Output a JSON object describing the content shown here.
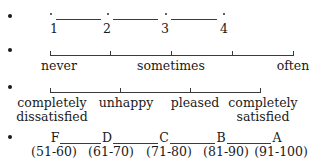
{
  "scales": [
    {
      "type": "numeric",
      "labels": [
        "1",
        "2",
        "3",
        "4"
      ]
    },
    {
      "type": "frequency",
      "labels": [
        "never",
        "sometimes",
        "often"
      ]
    },
    {
      "type": "satisfaction",
      "labels": [
        {
          "line1": "completely",
          "line2": "dissatisfied"
        },
        {
          "line1": "unhappy",
          "line2": ""
        },
        {
          "line1": "pleased",
          "line2": ""
        },
        {
          "line1": "completely",
          "line2": "satisfied"
        }
      ]
    },
    {
      "type": "grades",
      "grades": [
        {
          "letter": "F",
          "range": "(51-60)"
        },
        {
          "letter": "D",
          "range": "(61-70)"
        },
        {
          "letter": "C",
          "range": "(71-80)"
        },
        {
          "letter": "B",
          "range": "(81-90)"
        },
        {
          "letter": "A",
          "range": "(91-100)"
        }
      ]
    }
  ]
}
